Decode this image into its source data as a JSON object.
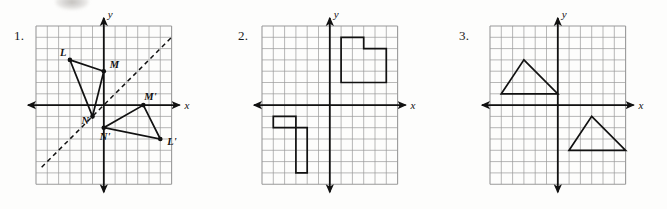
{
  "page": {
    "background_color": "#fdfdfc",
    "grid_line_color": "#9a9a9a",
    "ink_color": "#111111"
  },
  "problems": [
    {
      "number": "1.",
      "axis_x_label": "x",
      "axis_y_label": "y",
      "grid": {
        "cols": 12,
        "rows": 14,
        "origin_col": 6,
        "origin_row": 7
      },
      "has_dashed_line": true,
      "dashed_line": {
        "description": "line of reflection y = x",
        "from": [
          -5.5,
          -5.5
        ],
        "to": [
          6,
          6
        ]
      },
      "shapes": [
        {
          "name": "triangle-LMN",
          "type": "polygon",
          "points": [
            [
              -3,
              4
            ],
            [
              0,
              3
            ],
            [
              -1,
              -1
            ]
          ],
          "vertex_labels": [
            "L",
            "M",
            "N"
          ],
          "label_offsets": [
            [
              -10,
              -4
            ],
            [
              6,
              -3
            ],
            [
              -11,
              8
            ]
          ]
        },
        {
          "name": "triangle-L-prime-M-prime-N-prime",
          "type": "polygon",
          "points": [
            [
              5,
              -3
            ],
            [
              3.5,
              0
            ],
            [
              0,
              -2
            ]
          ],
          "vertex_labels": [
            "L'",
            "M'",
            "N'"
          ],
          "label_offsets": [
            [
              7,
              6
            ],
            [
              1,
              -5
            ],
            [
              -4,
              12
            ]
          ]
        }
      ]
    },
    {
      "number": "2.",
      "axis_x_label": "x",
      "axis_y_label": "y",
      "grid": {
        "cols": 12,
        "rows": 14,
        "origin_col": 6,
        "origin_row": 7
      },
      "has_dashed_line": false,
      "shapes": [
        {
          "name": "L-shape-upper-right",
          "type": "polyline-closed",
          "points": [
            [
              1,
              2
            ],
            [
              1,
              6
            ],
            [
              3,
              6
            ],
            [
              3,
              5
            ],
            [
              5,
              5
            ],
            [
              5,
              2
            ]
          ],
          "vertex_labels": [],
          "label_offsets": []
        },
        {
          "name": "L-shape-lower-left",
          "type": "polyline-closed",
          "points": [
            [
              -5,
              -1
            ],
            [
              -5,
              -2
            ],
            [
              -2,
              -2
            ],
            [
              -2,
              -6
            ],
            [
              -3,
              -6
            ],
            [
              -3,
              -1
            ]
          ],
          "vertex_labels": [],
          "label_offsets": []
        }
      ]
    },
    {
      "number": "3.",
      "axis_x_label": "x",
      "axis_y_label": "y",
      "grid": {
        "cols": 12,
        "rows": 14,
        "origin_col": 6,
        "origin_row": 7
      },
      "has_dashed_line": false,
      "shapes": [
        {
          "name": "triangle-upper-left",
          "type": "polygon",
          "points": [
            [
              -5,
              1
            ],
            [
              -3,
              4
            ],
            [
              0,
              1
            ]
          ],
          "vertex_labels": [],
          "label_offsets": []
        },
        {
          "name": "triangle-lower-right",
          "type": "polygon",
          "points": [
            [
              1,
              -4
            ],
            [
              3,
              -1
            ],
            [
              6,
              -4
            ]
          ],
          "vertex_labels": [],
          "label_offsets": []
        }
      ]
    }
  ],
  "chart_data": {
    "type": "scatter",
    "xlabel": "x",
    "ylabel": "y",
    "grid": true,
    "legend": "none",
    "panels": [
      {
        "label": "1.",
        "xlim": [
          -6,
          6
        ],
        "ylim": [
          -7,
          7
        ],
        "annotations": [
          "L",
          "M",
          "N",
          "L'",
          "M'",
          "N'"
        ],
        "series": [
          {
            "name": "triangle LMN",
            "x": [
              -3,
              0,
              -1,
              -3
            ],
            "y": [
              4,
              3,
              -1,
              4
            ]
          },
          {
            "name": "triangle L'M'N'",
            "x": [
              5,
              3.5,
              0,
              5
            ],
            "y": [
              -3,
              0,
              -2,
              -3
            ]
          },
          {
            "name": "reflection line y = x (dashed)",
            "x": [
              -5.5,
              6
            ],
            "y": [
              -5.5,
              6
            ]
          }
        ]
      },
      {
        "label": "2.",
        "xlim": [
          -6,
          6
        ],
        "ylim": [
          -7,
          7
        ],
        "annotations": [],
        "series": [
          {
            "name": "L-shape upper right",
            "x": [
              1,
              1,
              3,
              3,
              5,
              5,
              1
            ],
            "y": [
              2,
              6,
              6,
              5,
              5,
              2,
              2
            ]
          },
          {
            "name": "L-shape lower left",
            "x": [
              -5,
              -5,
              -2,
              -2,
              -3,
              -3,
              -5
            ],
            "y": [
              -1,
              -2,
              -2,
              -6,
              -6,
              -1,
              -1
            ]
          }
        ]
      },
      {
        "label": "3.",
        "xlim": [
          -6,
          6
        ],
        "ylim": [
          -7,
          7
        ],
        "annotations": [],
        "series": [
          {
            "name": "triangle upper left",
            "x": [
              -5,
              -3,
              0,
              -5
            ],
            "y": [
              1,
              4,
              1,
              1
            ]
          },
          {
            "name": "triangle lower right",
            "x": [
              1,
              3,
              6,
              1
            ],
            "y": [
              -4,
              -1,
              -4,
              -4
            ]
          }
        ]
      }
    ]
  }
}
